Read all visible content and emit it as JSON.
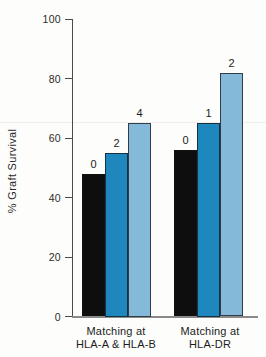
{
  "chart_data": {
    "type": "bar",
    "title": "",
    "xlabel": "",
    "ylabel": "% Graft Survival",
    "ylim": [
      0,
      100
    ],
    "yticks": [
      0,
      20,
      40,
      60,
      80,
      100
    ],
    "grid": false,
    "legend": null,
    "bar_colors": {
      "black": "#0e0e0e",
      "medium_blue": "#1e87be",
      "light_blue": "#84b9d9"
    },
    "groups": [
      {
        "label_line1": "Matching at",
        "label_line2": "HLA-A & HLA-B",
        "bars": [
          {
            "label": "0",
            "value": 48,
            "color": "#0e0e0e"
          },
          {
            "label": "2",
            "value": 55,
            "color": "#1e87be"
          },
          {
            "label": "4",
            "value": 65,
            "color": "#84b9d9"
          }
        ]
      },
      {
        "label_line1": "Matching at",
        "label_line2": "HLA-DR",
        "bars": [
          {
            "label": "0",
            "value": 56,
            "color": "#0e0e0e"
          },
          {
            "label": "1",
            "value": 65,
            "color": "#1e87be"
          },
          {
            "label": "2",
            "value": 82,
            "color": "#84b9d9"
          }
        ]
      }
    ]
  }
}
